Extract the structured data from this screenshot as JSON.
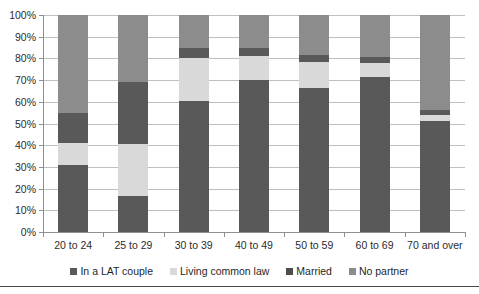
{
  "chart_data": {
    "type": "bar",
    "subtype": "stacked-100-percent",
    "title": "",
    "xlabel": "",
    "ylabel": "",
    "ylim": [
      0,
      100
    ],
    "ytick_labels": [
      "100%",
      "90%",
      "80%",
      "70%",
      "60%",
      "50%",
      "40%",
      "30%",
      "20%",
      "10%",
      "0%"
    ],
    "ytick_values": [
      100,
      90,
      80,
      70,
      60,
      50,
      40,
      30,
      20,
      10,
      0
    ],
    "grid": true,
    "legend_position": "bottom",
    "categories": [
      "20 to 24",
      "25 to 29",
      "30 to 39",
      "40 to 49",
      "50 to 59",
      "60 to 69",
      "70 and over"
    ],
    "series": [
      {
        "name": "In a LAT couple",
        "color": "#595959",
        "values": [
          14,
          28.5,
          5,
          4,
          3,
          2.5,
          2
        ]
      },
      {
        "name": "Living common law",
        "color": "#d9d9d9",
        "values": [
          10,
          24,
          19.5,
          11,
          12,
          6.5,
          3
        ]
      },
      {
        "name": "Married",
        "color": "#595959",
        "values": [
          31,
          16.5,
          60.5,
          70,
          66.5,
          71.5,
          51
        ]
      },
      {
        "name": "No partner",
        "color": "#8c8c8c",
        "values": [
          45,
          31,
          15,
          15,
          18.5,
          19.5,
          44
        ]
      }
    ],
    "stack_order_bottom_to_top": [
      "Married",
      "Living common law",
      "In a LAT couple",
      "No partner"
    ],
    "stack_tops": {
      "20 to 24": {
        "Married": 31,
        "Living common law": 41,
        "In a LAT couple": 45,
        "No partner": 100
      },
      "25 to 29": {
        "Married": 16.5,
        "Living common law": 40.5,
        "In a LAT couple": 69,
        "No partner": 100
      },
      "30 to 39": {
        "In a LAT couple": 5,
        "Living common law": 24.5,
        "Married": 85,
        "No partner": 100
      },
      "40 to 49": {
        "In a LAT couple": 4,
        "Living common law": 15,
        "Married": 85,
        "No partner": 100
      },
      "50 to 59": {
        "In a LAT couple": 3,
        "Living common law": 15,
        "Married": 81.5,
        "No partner": 100
      },
      "60 to 69": {
        "In a LAT couple": 2.5,
        "Living common law": 9,
        "Married": 80.5,
        "No partner": 100
      },
      "70 and over": {
        "In a LAT couple": 2,
        "Living common law": 5,
        "Married": 56,
        "No partner": 100
      }
    }
  },
  "legend": {
    "items": [
      {
        "label": "In a LAT couple",
        "color": "#595959"
      },
      {
        "label": "Living common law",
        "color": "#d9d9d9"
      },
      {
        "label": "Married",
        "color": "#4d4d4d"
      },
      {
        "label": "No partner",
        "color": "#8c8c8c"
      }
    ]
  },
  "colors": {
    "lat_couple": "#595959",
    "common_law": "#d9d9d9",
    "married": "#595959",
    "no_partner": "#8c8c8c",
    "gridline": "#bfbfbf",
    "axis": "#8f8f8f",
    "text": "#2b2b2b",
    "background": "#ffffff"
  }
}
